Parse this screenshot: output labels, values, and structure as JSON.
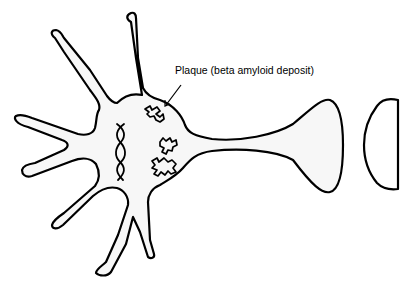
{
  "diagram": {
    "labels": {
      "plaque": "Plaque (beta amyloid deposit)"
    },
    "colors": {
      "outline": "#000000",
      "fill": "#f7f7f7",
      "background": "#ffffff"
    },
    "parts": [
      "cell body",
      "dendrites",
      "nucleus DNA helix",
      "plaques",
      "axon",
      "axon terminal",
      "post-synaptic membrane"
    ]
  }
}
